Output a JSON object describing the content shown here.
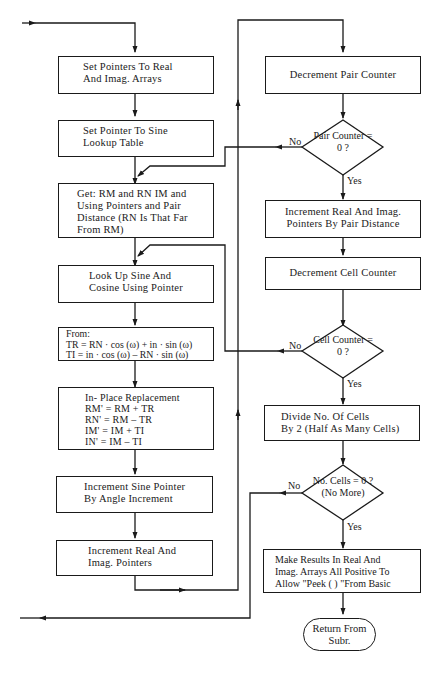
{
  "flowchart": {
    "left_column": [
      {
        "id": "set-pointers-arrays",
        "lines": [
          "Set Pointers To Real",
          "And Imag. Arrays"
        ]
      },
      {
        "id": "set-pointer-sine",
        "lines": [
          "Set Pointer To Sine",
          "Lookup Table"
        ]
      },
      {
        "id": "get-rm-rn",
        "lines": [
          "Get: RM and RN IM and",
          "Using Pointers and Pair",
          "Distance (RN Is That Far",
          "From RM)"
        ]
      },
      {
        "id": "lookup-sine-cosine",
        "lines": [
          "Look Up Sine And",
          "Cosine Using Pointer"
        ]
      },
      {
        "id": "from-formulas",
        "lines": [
          "From:",
          "TR = RN · cos (ω) + in · sin (ω)",
          "TI = in · cos (ω) – RN · sin (ω)"
        ]
      },
      {
        "id": "in-place-replacement",
        "lines": [
          "In- Place Replacement",
          "RM' = RM + TR",
          "RN' = RM – TR",
          "IM' = IM + TI",
          "IN'  = IM – TI"
        ]
      },
      {
        "id": "increment-sine-pointer",
        "lines": [
          "Increment Sine Pointer",
          "By Angle Increment"
        ]
      },
      {
        "id": "increment-real-imag",
        "lines": [
          "Increment Real And",
          "Imag. Pointers"
        ]
      }
    ],
    "right_column": [
      {
        "id": "decrement-pair-counter",
        "lines": [
          "Decrement Pair Counter"
        ]
      },
      {
        "id": "pair-counter-decision",
        "lines": [
          "Pair",
          "Counter",
          "= 0 ?"
        ],
        "no": "No",
        "yes": "Yes"
      },
      {
        "id": "increment-by-pair-distance",
        "lines": [
          "Increment Real And Imag.",
          "Pointers By Pair Distance"
        ]
      },
      {
        "id": "decrement-cell-counter",
        "lines": [
          "Decrement Cell Counter"
        ]
      },
      {
        "id": "cell-counter-decision",
        "lines": [
          "Cell",
          "Counter",
          "= 0 ?"
        ],
        "no": "No",
        "yes": "Yes"
      },
      {
        "id": "divide-cells",
        "lines": [
          "Divide No. Of Cells",
          "By 2 (Half As Many Cells)"
        ]
      },
      {
        "id": "cells-zero-decision",
        "lines": [
          "No.",
          "Cells  =  0 ?",
          "(No More)"
        ],
        "no": "No",
        "yes": "Yes"
      },
      {
        "id": "make-results-positive",
        "lines": [
          "Make Results In Real And",
          "Imag. Arrays All Positive To",
          "Allow \"Peek (   ) \"From Basic"
        ]
      },
      {
        "id": "return-from-subr",
        "lines": [
          "Return",
          "From Subr."
        ]
      }
    ]
  }
}
